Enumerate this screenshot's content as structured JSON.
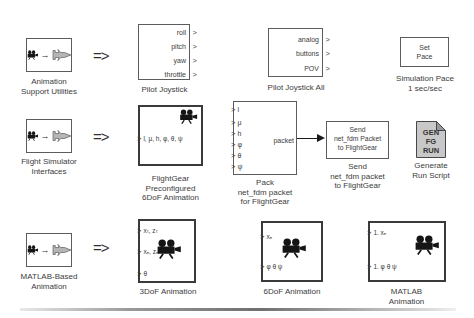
{
  "icons": {
    "implies": "=>",
    "flow_arrow": "→",
    "port_chevron": ">",
    "camera": "movie-camera-icon",
    "jet": "aircraft-icon",
    "script_doc": "script-document-icon"
  },
  "colors": {
    "background": "#ffffff",
    "block_border": "#5c5c5c",
    "animation_block_border": "#3a3a3a",
    "text": "#3c3c3c",
    "doc_fill": "#c8c8c8",
    "doc_fold": "#989898",
    "jet_fill": "#b5b5b5",
    "camera": "#151515"
  },
  "row1": {
    "library": {
      "lines": [
        "Animation",
        "Support Utilities"
      ]
    },
    "pilot_joystick": {
      "ports": [
        "roll",
        "pitch",
        "yaw",
        "throttle"
      ],
      "label": "Pilot Joystick"
    },
    "pilot_joystick_all": {
      "ports": [
        "analog",
        "buttons",
        "POV"
      ],
      "label": "Pilot Joystick All"
    },
    "set_pace": {
      "text": [
        "Set",
        "Pace"
      ],
      "caption": [
        "Simulation Pace",
        "1 sec/sec"
      ]
    }
  },
  "row2": {
    "library": {
      "lines": [
        "Flight Simulator",
        "Interfaces"
      ]
    },
    "flightgear_preconfigured": {
      "input": "l, μ, h, φ, θ, ψ",
      "caption": [
        "FlightGear",
        "Preconfigured",
        "6DoF Animation"
      ]
    },
    "pack_net_fdm": {
      "ports": [
        "l",
        "μ",
        "h",
        "φ",
        "θ",
        "ψ"
      ],
      "output": "packet",
      "caption": [
        "Pack",
        "net_fdm packet",
        "for FlightGear"
      ]
    },
    "send_net_fdm": {
      "text": [
        "Send",
        "net_fdm Packet",
        "to FlightGear"
      ],
      "caption": [
        "Send",
        "net_fdm packet",
        "to FlightGear"
      ]
    },
    "generate_run_script": {
      "text": [
        "GEN",
        "FG",
        "RUN"
      ],
      "caption": [
        "Generate",
        "Run Script"
      ]
    }
  },
  "row3": {
    "library": {
      "lines": [
        "MATLAB-Based",
        "Animation"
      ]
    },
    "dof3_animation": {
      "ports": [
        "xₜ, zₜ",
        "xₑ, zₑ",
        "θ"
      ],
      "label": "3DoF Animation"
    },
    "dof6_animation": {
      "ports": [
        "xₑ",
        "φ θ ψ"
      ],
      "label": "6DoF Animation"
    },
    "matlab_animation": {
      "ports": [
        "1. xₑ",
        "1. φ θ ψ"
      ],
      "caption": [
        "MATLAB",
        "Animation"
      ]
    }
  }
}
